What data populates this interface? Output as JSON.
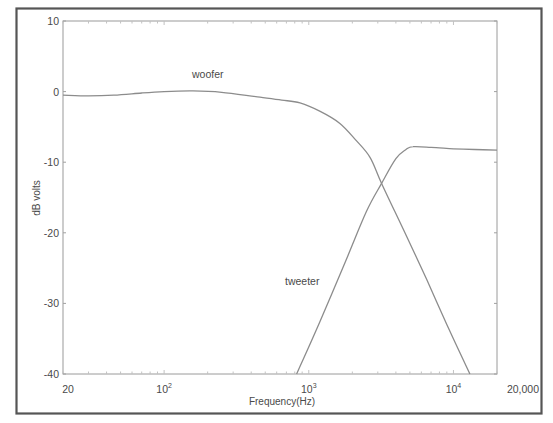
{
  "chart_data": {
    "type": "line",
    "title": "",
    "xlabel": "Frequency(Hz)",
    "ylabel": "dB volts",
    "xscale": "log",
    "xlim": [
      20,
      20000
    ],
    "ylim": [
      -40,
      10
    ],
    "grid": false,
    "legend": "inline labels",
    "x_ticks": [
      {
        "value": 20,
        "label": "20"
      },
      {
        "value": 100,
        "label": "10",
        "sup": "2"
      },
      {
        "value": 1000,
        "label": "10",
        "sup": "3"
      },
      {
        "value": 10000,
        "label": "10",
        "sup": "4"
      },
      {
        "value": 20000,
        "label": "20,000"
      }
    ],
    "y_ticks": [
      10,
      0,
      -10,
      -20,
      -30,
      -40
    ],
    "y_tick_labels": [
      "10",
      "0",
      "-10",
      "-20",
      "-30",
      "-40"
    ],
    "series": [
      {
        "name": "woofer",
        "label_position": {
          "x": 130,
          "y": 3.5
        },
        "points": [
          [
            20,
            -0.5
          ],
          [
            30,
            -0.6
          ],
          [
            45,
            -0.5
          ],
          [
            70,
            -0.2
          ],
          [
            100,
            0.0
          ],
          [
            158,
            0.1
          ],
          [
            250,
            -0.1
          ],
          [
            460,
            -0.8
          ],
          [
            650,
            -1.2
          ],
          [
            869,
            -1.6
          ],
          [
            1200,
            -2.8
          ],
          [
            1640,
            -4.5
          ],
          [
            2100,
            -6.8
          ],
          [
            2650,
            -9.3
          ],
          [
            3186,
            -13.0
          ],
          [
            4500,
            -19.5
          ],
          [
            6500,
            -26.5
          ],
          [
            9000,
            -33.0
          ],
          [
            13000,
            -40.0
          ]
        ]
      },
      {
        "name": "tweeter",
        "label_position": {
          "x": 1150,
          "y": -27
        },
        "points": [
          [
            824,
            -40.0
          ],
          [
            1200,
            -32.5
          ],
          [
            1800,
            -24.0
          ],
          [
            2500,
            -17.0
          ],
          [
            3186,
            -13.0
          ],
          [
            4000,
            -9.5
          ],
          [
            4700,
            -8.2
          ],
          [
            5250,
            -7.8
          ],
          [
            7000,
            -7.9
          ],
          [
            10000,
            -8.1
          ],
          [
            14000,
            -8.2
          ],
          [
            20000,
            -8.3
          ]
        ]
      }
    ]
  },
  "labels": {
    "xlabel": "Frequency(Hz)",
    "ylabel": "dB volts",
    "woofer": "woofer",
    "tweeter": "tweeter"
  }
}
